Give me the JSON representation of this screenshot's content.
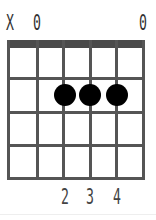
{
  "chord": {
    "open_markers": [
      {
        "string": 1,
        "label": "X",
        "x": 10
      },
      {
        "string": 2,
        "label": "0",
        "x": 37
      },
      {
        "string": 6,
        "label": "0",
        "x": 143
      }
    ],
    "strings_x": [
      8,
      37,
      63,
      90,
      116,
      143
    ],
    "frets_y": [
      78,
      112,
      145,
      178
    ],
    "dots": [
      {
        "string": 3,
        "fret": 2,
        "x": 65,
        "y": 95
      },
      {
        "string": 4,
        "fret": 2,
        "x": 90,
        "y": 95
      },
      {
        "string": 5,
        "fret": 2,
        "x": 117,
        "y": 95
      }
    ],
    "fingers": [
      {
        "string": 3,
        "label": "2",
        "x": 65
      },
      {
        "string": 4,
        "label": "3",
        "x": 90
      },
      {
        "string": 5,
        "label": "4",
        "x": 117
      }
    ]
  },
  "colors": {
    "grid": "#555555",
    "nut": "#4a4a4a",
    "dot": "#000000",
    "text": "#333333"
  }
}
